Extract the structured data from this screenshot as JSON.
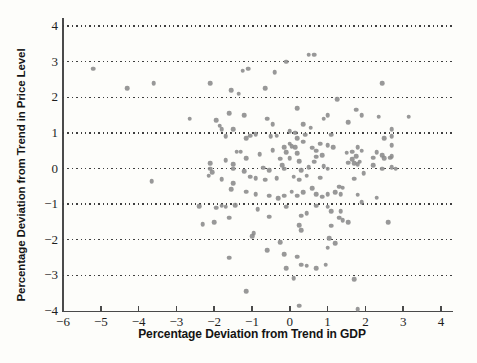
{
  "figure": {
    "background_color": "#fdfdfa",
    "axis_color": "#4a4a4a",
    "tick_label_color": "#1e1e1e",
    "title_color": "#141414"
  },
  "chart_data": {
    "type": "scatter",
    "title": "",
    "xlabel": "Percentage Deviation from Trend in GDP",
    "ylabel": "Percentage Deviation from Trend in Price Level",
    "xlim": [
      -6,
      4
    ],
    "ylim": [
      -4,
      4
    ],
    "x_tick_values": [
      -6,
      -5,
      -4,
      -3,
      -2,
      -1,
      0,
      1,
      2,
      3,
      4
    ],
    "x_tick_labels": [
      "−6",
      "−5",
      "−4",
      "−3",
      "−2",
      "−1",
      "0",
      "1",
      "2",
      "3",
      "4"
    ],
    "y_tick_values": [
      -4,
      -3,
      -2,
      -1,
      0,
      1,
      2,
      3,
      4
    ],
    "y_tick_labels": [
      "−4",
      "−3",
      "−2",
      "−1",
      "0",
      "1",
      "2",
      "3",
      "4"
    ],
    "grid": "horizontal-dotted",
    "gridline_values": [
      4,
      3,
      2,
      1,
      0,
      -1,
      -2,
      -3
    ],
    "legend": "none",
    "marker": "dot",
    "marker_color": "#8a8a8a",
    "points": [
      [
        -5.2,
        2.8
      ],
      [
        -4.3,
        2.25
      ],
      [
        -3.6,
        2.4
      ],
      [
        -2.1,
        2.4
      ],
      [
        -1.25,
        2.75
      ],
      [
        -1.1,
        2.8
      ],
      [
        -0.4,
        2.7
      ],
      [
        -0.1,
        3.0
      ],
      [
        0.5,
        3.2
      ],
      [
        0.65,
        3.2
      ],
      [
        2.45,
        2.4
      ],
      [
        -1.55,
        2.2
      ],
      [
        -1.35,
        2.1
      ],
      [
        -0.65,
        2.25
      ],
      [
        1.25,
        1.95
      ],
      [
        -2.65,
        1.4
      ],
      [
        -1.95,
        1.35
      ],
      [
        -1.6,
        1.55
      ],
      [
        -1.2,
        1.5
      ],
      [
        -0.6,
        1.4
      ],
      [
        -0.45,
        1.25
      ],
      [
        0.2,
        1.7
      ],
      [
        0.35,
        1.25
      ],
      [
        0.55,
        1.15
      ],
      [
        0.9,
        1.4
      ],
      [
        1.0,
        1.5
      ],
      [
        1.55,
        1.3
      ],
      [
        1.75,
        1.65
      ],
      [
        1.9,
        1.5
      ],
      [
        2.35,
        1.45
      ],
      [
        3.15,
        1.45
      ],
      [
        2.7,
        1.1
      ],
      [
        -1.85,
        1.2
      ],
      [
        -1.8,
        1.1
      ],
      [
        -1.5,
        1.1
      ],
      [
        0.0,
        1.05
      ],
      [
        0.15,
        1.0
      ],
      [
        1.1,
        0.95
      ],
      [
        -1.7,
        0.9
      ],
      [
        -1.15,
        0.85
      ],
      [
        -1.05,
        0.92
      ],
      [
        -0.9,
        0.96
      ],
      [
        -0.5,
        0.9
      ],
      [
        -0.35,
        0.92
      ],
      [
        0.2,
        0.85
      ],
      [
        0.4,
        0.95
      ],
      [
        2.5,
        0.85
      ],
      [
        2.7,
        0.9
      ],
      [
        0.35,
        0.75
      ],
      [
        0.0,
        0.7
      ],
      [
        0.05,
        0.63
      ],
      [
        0.15,
        0.6
      ],
      [
        -0.15,
        0.6
      ],
      [
        0.8,
        0.7
      ],
      [
        1.0,
        0.65
      ],
      [
        1.15,
        0.6
      ],
      [
        2.7,
        0.65
      ],
      [
        1.8,
        0.6
      ],
      [
        1.9,
        0.5
      ],
      [
        0.7,
        0.5
      ],
      [
        -1.4,
        0.47
      ],
      [
        -1.3,
        0.47
      ],
      [
        -0.8,
        0.4
      ],
      [
        -0.45,
        0.52
      ],
      [
        -0.1,
        0.45
      ],
      [
        0.2,
        0.43
      ],
      [
        0.6,
        0.58
      ],
      [
        0.7,
        0.33
      ],
      [
        0.85,
        0.38
      ],
      [
        1.5,
        0.44
      ],
      [
        1.65,
        0.47
      ],
      [
        1.75,
        0.35
      ],
      [
        2.3,
        0.45
      ],
      [
        2.45,
        0.38
      ],
      [
        2.65,
        0.3
      ],
      [
        2.7,
        0.35
      ],
      [
        -2.1,
        0.15
      ],
      [
        -1.7,
        0.24
      ],
      [
        -1.5,
        0.12
      ],
      [
        -1.15,
        0.29
      ],
      [
        -0.25,
        0.27
      ],
      [
        -0.2,
        0.1
      ],
      [
        0.0,
        0.29
      ],
      [
        0.25,
        0.21
      ],
      [
        0.65,
        0.19
      ],
      [
        0.9,
        0.07
      ],
      [
        1.55,
        0.16
      ],
      [
        1.65,
        0.26
      ],
      [
        1.7,
        0.15
      ],
      [
        1.85,
        0.19
      ],
      [
        1.8,
        0.12
      ],
      [
        2.2,
        0.3
      ],
      [
        2.2,
        0.1
      ],
      [
        2.5,
        0.29
      ],
      [
        -2.1,
        0.0
      ],
      [
        -2.05,
        -0.1
      ],
      [
        -1.5,
        0.0
      ],
      [
        -1.2,
        -0.07
      ],
      [
        -0.7,
        0.02
      ],
      [
        -0.55,
        -0.04
      ],
      [
        -0.15,
        0.0
      ],
      [
        0.3,
        -0.04
      ],
      [
        0.5,
        0.03
      ],
      [
        1.0,
        0.0
      ],
      [
        2.45,
        0.0
      ],
      [
        2.8,
        0.0
      ],
      [
        2.7,
        0.03
      ],
      [
        -2.15,
        -0.2
      ],
      [
        -1.8,
        -0.3
      ],
      [
        -1.05,
        -0.23
      ],
      [
        -0.9,
        -0.28
      ],
      [
        -0.65,
        -0.32
      ],
      [
        -0.35,
        -0.28
      ],
      [
        0.1,
        -0.23
      ],
      [
        0.25,
        -0.32
      ],
      [
        0.45,
        -0.2
      ],
      [
        0.8,
        -0.26
      ],
      [
        1.95,
        -0.13
      ],
      [
        -3.65,
        -0.35
      ],
      [
        -1.5,
        -0.42
      ],
      [
        -1.55,
        -0.58
      ],
      [
        -1.15,
        -0.65
      ],
      [
        -0.9,
        -0.72
      ],
      [
        -0.55,
        -0.76
      ],
      [
        -0.3,
        -0.84
      ],
      [
        -0.15,
        -0.76
      ],
      [
        0.05,
        -0.65
      ],
      [
        0.2,
        -0.76
      ],
      [
        0.35,
        -0.67
      ],
      [
        0.6,
        -0.56
      ],
      [
        0.7,
        -0.72
      ],
      [
        0.85,
        -0.79
      ],
      [
        1.0,
        -0.72
      ],
      [
        1.7,
        -0.29
      ],
      [
        1.3,
        -0.51
      ],
      [
        1.4,
        -0.54
      ],
      [
        1.2,
        -0.67
      ],
      [
        1.35,
        -0.72
      ],
      [
        1.8,
        -0.74
      ],
      [
        1.9,
        -0.95
      ],
      [
        2.3,
        -0.82
      ],
      [
        -2.4,
        -1.05
      ],
      [
        -1.95,
        -1.1
      ],
      [
        -1.8,
        -1.04
      ],
      [
        -1.7,
        -1.07
      ],
      [
        -1.45,
        -1.03
      ],
      [
        -0.85,
        -1.14
      ],
      [
        -0.1,
        -1.07
      ],
      [
        0.7,
        -1.04
      ],
      [
        1.0,
        -1.07
      ],
      [
        1.1,
        -1.2
      ],
      [
        1.35,
        -1.2
      ],
      [
        -2.0,
        -1.5
      ],
      [
        -1.6,
        -1.38
      ],
      [
        -0.55,
        -1.35
      ],
      [
        0.3,
        -1.33
      ],
      [
        0.45,
        -1.26
      ],
      [
        -2.3,
        -1.57
      ],
      [
        0.25,
        -1.59
      ],
      [
        1.1,
        -1.6
      ],
      [
        1.3,
        -1.38
      ],
      [
        1.4,
        -1.45
      ],
      [
        1.55,
        -1.5
      ],
      [
        2.6,
        -1.5
      ],
      [
        -0.95,
        -1.82
      ],
      [
        0.3,
        -1.73
      ],
      [
        -1.0,
        -1.9
      ],
      [
        1.05,
        -1.95
      ],
      [
        1.2,
        -2.1
      ],
      [
        -0.25,
        -2.07
      ],
      [
        -0.6,
        -2.3
      ],
      [
        1.0,
        -2.22
      ],
      [
        -0.15,
        -2.41
      ],
      [
        -1.6,
        -2.5
      ],
      [
        0.2,
        -2.48
      ],
      [
        0.3,
        -2.7
      ],
      [
        -0.1,
        -2.8
      ],
      [
        0.45,
        -2.73
      ],
      [
        0.7,
        -2.8
      ],
      [
        0.95,
        -2.7
      ],
      [
        0.1,
        -3.08
      ],
      [
        1.7,
        -3.1
      ],
      [
        -1.15,
        -3.45
      ],
      [
        0.25,
        -3.85
      ],
      [
        1.8,
        -3.95
      ]
    ]
  }
}
